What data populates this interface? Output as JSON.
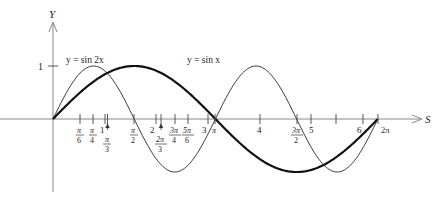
{
  "chart_data": {
    "type": "line",
    "title": "",
    "xlabel": "S",
    "ylabel": "Y",
    "xlim": [
      0,
      6.2832
    ],
    "ylim": [
      -1,
      1
    ],
    "grid": false,
    "series": [
      {
        "name": "y = sin x",
        "style": "thick",
        "x": [
          0,
          0.5236,
          0.7854,
          1.0472,
          1.5708,
          2.0944,
          2.3562,
          2.618,
          3.1416,
          3.927,
          4.7124,
          5.4978,
          6.2832
        ],
        "values": [
          0,
          0.5,
          0.7071,
          0.866,
          1,
          0.866,
          0.7071,
          0.5,
          0,
          -0.7071,
          -1,
          -0.7071,
          0
        ]
      },
      {
        "name": "y = sin 2x",
        "style": "thin",
        "x": [
          0,
          0.3927,
          0.7854,
          1.1781,
          1.5708,
          1.9635,
          2.3562,
          2.7489,
          3.1416,
          3.927,
          4.7124,
          5.4978,
          6.2832
        ],
        "values": [
          0,
          0.7071,
          1,
          0.7071,
          0,
          -0.7071,
          -1,
          -0.7071,
          0,
          1,
          0,
          -1,
          0
        ]
      }
    ],
    "y_ticks": [
      {
        "value": 1,
        "label": "1"
      }
    ],
    "x_ticks_integer": [
      {
        "value": 1,
        "label": "1"
      },
      {
        "value": 2,
        "label": "2"
      },
      {
        "value": 3,
        "label": "3"
      },
      {
        "value": 4,
        "label": "4"
      },
      {
        "value": 5,
        "label": "5"
      },
      {
        "value": 6,
        "label": "6"
      }
    ],
    "x_ticks_pi": [
      {
        "value": 0.5236,
        "num": "π",
        "den": "6"
      },
      {
        "value": 0.7854,
        "num": "π",
        "den": "4"
      },
      {
        "value": 1.0472,
        "num": "π",
        "den": "3"
      },
      {
        "value": 1.5708,
        "num": "π",
        "den": "2"
      },
      {
        "value": 2.0944,
        "num": "2π",
        "den": "3"
      },
      {
        "value": 2.3562,
        "num": "3π",
        "den": "4"
      },
      {
        "value": 2.618,
        "num": "5π",
        "den": "6"
      },
      {
        "value": 3.1416,
        "label": "π"
      },
      {
        "value": 4.7124,
        "num": "3π",
        "den": "2"
      },
      {
        "value": 6.2832,
        "label": "2π"
      }
    ],
    "annotations": [
      {
        "text": "y = sin 2x",
        "near": "first peak of sin 2x"
      },
      {
        "text": "y = sin x",
        "near": "peak of sin x"
      }
    ]
  },
  "labels": {
    "y_axis": "Y",
    "x_axis": "S",
    "one": "1",
    "sin2x": "y = sin 2x",
    "sinx": "y = sin x",
    "pi_over_6_num": "π",
    "pi_over_6_den": "6",
    "pi_over_4_num": "π",
    "pi_over_4_den": "4",
    "pi_over_3_num": "π",
    "pi_over_3_den": "3",
    "pi_over_2_num": "π",
    "pi_over_2_den": "2",
    "two_pi_over_3_num": "2π",
    "two_pi_over_3_den": "3",
    "three_pi_over_4_num": "3π",
    "three_pi_over_4_den": "4",
    "five_pi_over_6_num": "5π",
    "five_pi_over_6_den": "6",
    "three_pi_over_2_num": "3π",
    "three_pi_over_2_den": "2",
    "pi": "π",
    "two_pi": "2π",
    "n1": "1",
    "n2": "2",
    "n3": "3",
    "n4": "4",
    "n5": "5",
    "n6": "6"
  }
}
